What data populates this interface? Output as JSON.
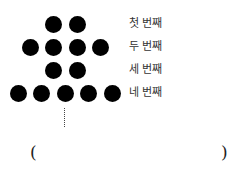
{
  "figure": {
    "rows": [
      {
        "label": "첫 번째",
        "count": 2,
        "dots_x": [
          53,
          77
        ],
        "y": 24
      },
      {
        "label": "두 번째",
        "count": 4,
        "dots_x": [
          30,
          53,
          77,
          100
        ],
        "y": 47
      },
      {
        "label": "세 번째",
        "count": 2,
        "dots_x": [
          53,
          77
        ],
        "y": 70
      },
      {
        "label": "네 번째",
        "count": 5,
        "dots_x": [
          18,
          41,
          65,
          88,
          112
        ],
        "y": 93
      }
    ],
    "continuation": "⋮",
    "answer_box": {
      "open": "(",
      "close": ")",
      "value": ""
    }
  }
}
